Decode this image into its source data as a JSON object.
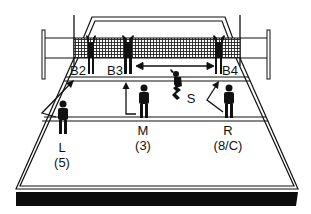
{
  "diagram": {
    "colors": {
      "line": "#111111",
      "background": "#ffffff",
      "shadow": "#0a0a0a"
    },
    "net": {
      "type": "mesh"
    },
    "blockers": [
      {
        "id": "B2",
        "label": "B2"
      },
      {
        "id": "B3",
        "label": "B3"
      },
      {
        "id": "B4",
        "label": "B4"
      }
    ],
    "setter": {
      "label": "S"
    },
    "back_row": [
      {
        "label": "L",
        "number": "(5)"
      },
      {
        "label": "M",
        "number": "(3)"
      },
      {
        "label": "R",
        "number": "(8/C)"
      }
    ],
    "arrows": [
      {
        "name": "blocker-shift-arrow",
        "from": "B3",
        "to": "B4",
        "type": "double-headed"
      },
      {
        "name": "middle-back-move-arrow",
        "type": "L-shaped up"
      },
      {
        "name": "right-back-move-arrow",
        "type": "angled up-left"
      },
      {
        "name": "left-back-move-arrow",
        "type": "angled up-right"
      }
    ]
  }
}
